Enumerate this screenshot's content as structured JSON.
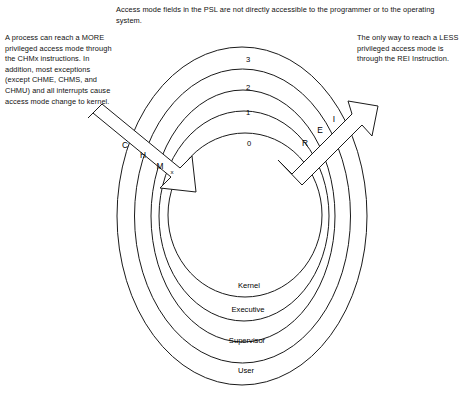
{
  "notes": {
    "top": "Access mode fields in the PSL are not directly accessible to the programmer or to the operating system.",
    "left": "A process can reach a MORE privileged access mode through the CHMx instructions. In addition, most exceptions (except CHME, CHMS, and CHMU) and all interrupts cause access mode change to kernel.",
    "right": "The only way to reach a LESS privileged access mode is through the REI Instruction."
  },
  "diagram": {
    "rings": [
      {
        "number": "3",
        "name": "User"
      },
      {
        "number": "2",
        "name": "Supervisor"
      },
      {
        "number": "1",
        "name": "Executive"
      },
      {
        "number": "0",
        "name": "Kernel"
      }
    ],
    "arrows": [
      {
        "id": "chmx",
        "direction": "inward",
        "letters": [
          "C",
          "H",
          "M",
          "x"
        ]
      },
      {
        "id": "rei",
        "direction": "outward",
        "letters": [
          "R",
          "E",
          "I"
        ]
      }
    ],
    "colors": {
      "stroke": "#1a1a1a",
      "fill": "#ffffff",
      "text": "#000000"
    }
  }
}
